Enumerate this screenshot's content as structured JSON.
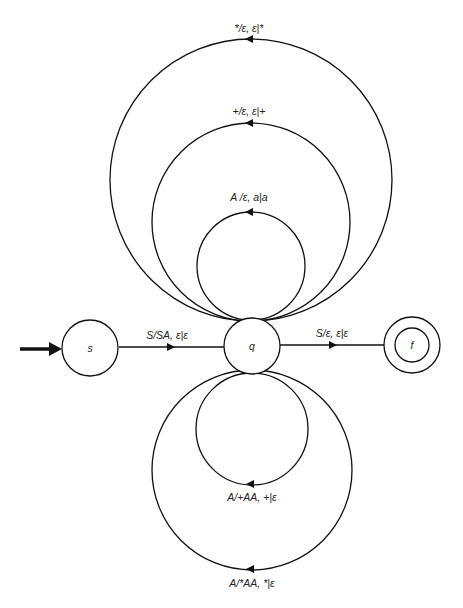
{
  "diagram": {
    "type": "pushdown automaton state diagram",
    "states": [
      {
        "id": "s",
        "label": "s",
        "start": true,
        "accepting": false
      },
      {
        "id": "q",
        "label": "q",
        "start": false,
        "accepting": false
      },
      {
        "id": "f",
        "label": "f",
        "start": false,
        "accepting": true
      }
    ],
    "transitions": [
      {
        "id": "s-q",
        "from": "s",
        "to": "q",
        "label": "S/SA, ε|ε"
      },
      {
        "id": "q-f",
        "from": "q",
        "to": "f",
        "label": "S/ε, ε|ε"
      },
      {
        "id": "loop-a",
        "from": "q",
        "to": "q",
        "label": "A /ε, a|a"
      },
      {
        "id": "loop-plus",
        "from": "q",
        "to": "q",
        "label": "+/ε, ε|+"
      },
      {
        "id": "loop-star",
        "from": "q",
        "to": "q",
        "label": "*/ε, ε|*"
      },
      {
        "id": "loop-plusAA",
        "from": "q",
        "to": "q",
        "label": "A/+AA, +|ε"
      },
      {
        "id": "loop-starAA",
        "from": "q",
        "to": "q",
        "label": "A/*AA, *|ε"
      }
    ]
  }
}
